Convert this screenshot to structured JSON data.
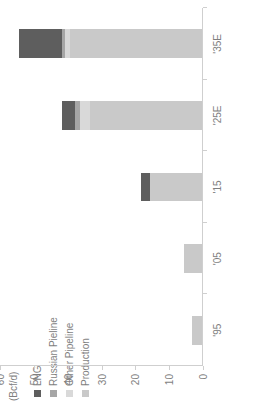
{
  "chart": {
    "unit_label": "(Bcf/d)",
    "rotation_note": "figure rendered rotated 90 degrees counter-clockwise"
  },
  "legend": {
    "position": "top-left",
    "items": [
      {
        "label": "LNG",
        "color": "#5e5e5e"
      },
      {
        "label": "Russian Pieline",
        "color": "#a6a6a6"
      },
      {
        "label": "Other Pipeline",
        "color": "#d9d9d9"
      },
      {
        "label": "Production",
        "color": "#c9c9c9"
      }
    ]
  },
  "chart_data": {
    "type": "bar",
    "subtype": "stacked-column",
    "title": "",
    "xlabel": "",
    "ylabel": "(Bcf/d)",
    "ylim": [
      0,
      60
    ],
    "ytick_labels": [
      "0",
      "10",
      "20",
      "30",
      "40",
      "50",
      "60"
    ],
    "ytick_values": [
      0,
      10,
      20,
      30,
      40,
      50,
      60
    ],
    "grid": false,
    "categories": [
      "'95",
      "'05",
      "'15",
      "'25E",
      "'35E"
    ],
    "series": [
      {
        "name": "Production",
        "color": "#c9c9c9",
        "values": [
          3.0,
          5.2,
          15.5,
          33.0,
          39.0
        ]
      },
      {
        "name": "Other Pipeline",
        "color": "#d9d9d9",
        "values": [
          0.0,
          0.0,
          0.0,
          3.0,
          1.5
        ]
      },
      {
        "name": "Russian Pieline",
        "color": "#a6a6a6",
        "values": [
          0.0,
          0.0,
          0.0,
          1.5,
          1.0
        ]
      },
      {
        "name": "LNG",
        "color": "#5e5e5e",
        "values": [
          0.0,
          0.0,
          2.5,
          4.0,
          12.5
        ]
      }
    ],
    "totals": [
      3.0,
      5.2,
      18.0,
      41.5,
      54.0
    ]
  }
}
